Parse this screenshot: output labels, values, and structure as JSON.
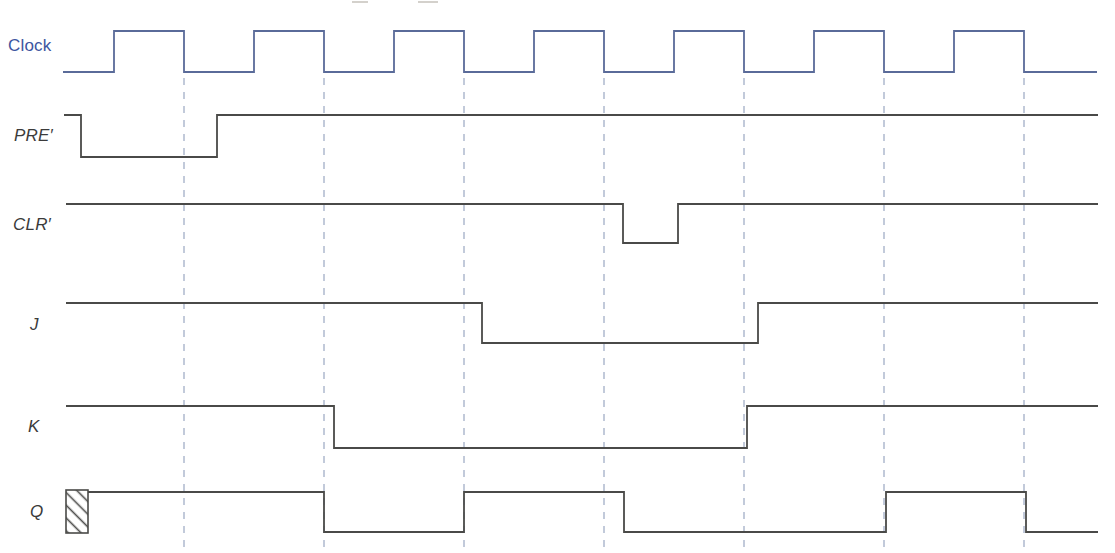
{
  "figure": {
    "background": "#ffffff",
    "dashed_guide_color": "#a9b4cb",
    "signals": [
      {
        "id": "clock",
        "label": "Clock",
        "color": "#5a6b99",
        "label_color": "#3d55a0",
        "italic": false,
        "high_y": 31,
        "low_y": 72,
        "start_x": 63,
        "end_x": 1097,
        "initial": "low",
        "edges": [
          114,
          184,
          254,
          324,
          394,
          464,
          534,
          604,
          674,
          744,
          814,
          884,
          954,
          1024
        ]
      },
      {
        "id": "pre",
        "label": "PRE′",
        "color": "#4a4a48",
        "label_color": "#3b3b3b",
        "italic": true,
        "high_y": 115,
        "low_y": 157,
        "start_x": 64,
        "end_x": 1098,
        "initial": "high",
        "edges": [
          81,
          217
        ]
      },
      {
        "id": "clr",
        "label": "CLR′",
        "color": "#4a4a48",
        "label_color": "#3b3b3b",
        "italic": true,
        "high_y": 204,
        "low_y": 243,
        "start_x": 66,
        "end_x": 1098,
        "initial": "high",
        "edges": [
          623,
          678
        ]
      },
      {
        "id": "j",
        "label": "J",
        "color": "#4a4a48",
        "label_color": "#3b3b3b",
        "italic": true,
        "high_y": 303,
        "low_y": 343,
        "start_x": 66,
        "end_x": 1098,
        "initial": "high",
        "edges": [
          482,
          758
        ]
      },
      {
        "id": "k",
        "label": "K",
        "color": "#4a4a48",
        "label_color": "#3b3b3b",
        "italic": true,
        "high_y": 406,
        "low_y": 448,
        "start_x": 66,
        "end_x": 1098,
        "initial": "high",
        "edges": [
          334,
          747
        ]
      },
      {
        "id": "q",
        "label": "Q",
        "color": "#4a4a48",
        "label_color": "#3b3b3b",
        "italic": true,
        "high_y": 492,
        "low_y": 532,
        "start_x": 88,
        "end_x": 1098,
        "initial": "high",
        "edges": [
          324,
          464,
          624,
          886,
          1026
        ]
      }
    ],
    "clock_edge_guides": {
      "x": [
        184,
        324,
        464,
        604,
        744,
        884,
        1024
      ],
      "y_top": 78,
      "y_bottom": 553
    },
    "unknown_state_box": {
      "x": 66,
      "y": 490,
      "width": 22,
      "height": 43,
      "hatch": "diagonal"
    }
  }
}
